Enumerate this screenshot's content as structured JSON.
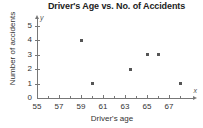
{
  "chart_data": {
    "type": "scatter",
    "title": "Driver's Age vs. No. of Accidents",
    "xlabel": "Driver's age",
    "ylabel": "Number of accidents",
    "xlim": [
      55,
      68.5
    ],
    "ylim": [
      0,
      5.3
    ],
    "grid": false,
    "legend": null,
    "x_axis_letter": "x",
    "y_axis_letter": "y",
    "xticks": [
      55,
      56,
      57,
      58,
      59,
      60,
      61,
      62,
      63,
      64,
      65,
      66,
      67,
      68
    ],
    "xtick_labels": [
      "55",
      "",
      "57",
      "",
      "59",
      "",
      "61",
      "",
      "63",
      "",
      "65",
      "",
      "67",
      ""
    ],
    "yticks": [
      0,
      1,
      2,
      3,
      4,
      5
    ],
    "ytick_labels": [
      "0",
      "1",
      "2",
      "3",
      "4",
      "5"
    ],
    "points": [
      {
        "x": 59,
        "y": 4
      },
      {
        "x": 60,
        "y": 1
      },
      {
        "x": 63.5,
        "y": 2
      },
      {
        "x": 65,
        "y": 3
      },
      {
        "x": 66,
        "y": 3
      },
      {
        "x": 68,
        "y": 1
      }
    ],
    "marker_color": "#555555",
    "axis_color": "#777777",
    "background": "#ffffff"
  }
}
